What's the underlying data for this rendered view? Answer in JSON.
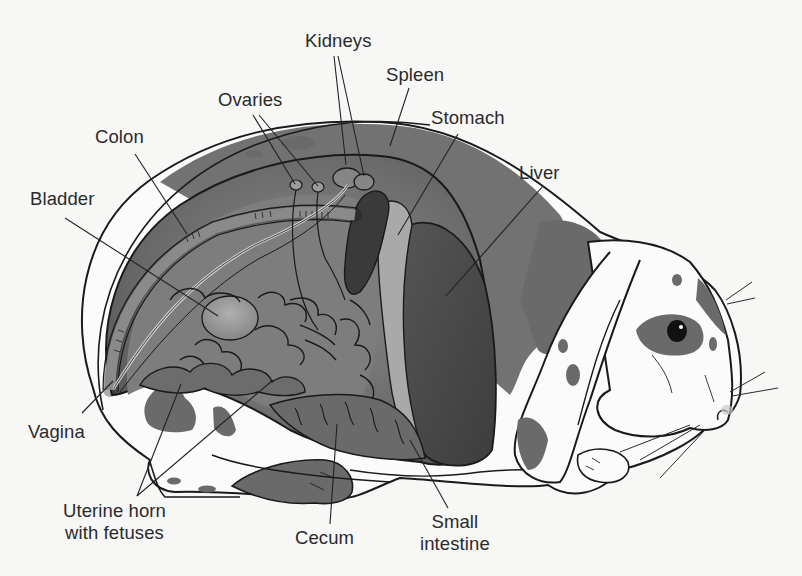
{
  "figure": {
    "colors": {
      "background": "#f7f7f6",
      "body_fur_white": "#fbfbfb",
      "body_spot": "#6a6a6a",
      "cavity_outer": "#5e5e5e",
      "cavity_inner": "#7a7a7a",
      "liver": "#4a4a4a",
      "stomach": "#a9a9a9",
      "spleen": "#3a3a3a",
      "intestine": "#6c6c6c",
      "bladder": "#8f8f8f",
      "outline": "#1a1a1a",
      "label_text": "#2a2a2a"
    }
  },
  "labels": [
    {
      "id": "kidneys",
      "lines": [
        "Kidneys"
      ],
      "x": 305,
      "y": 30,
      "align": "left",
      "leaders": [
        [
          334,
          56,
          346,
          165
        ],
        [
          338,
          56,
          364,
          176
        ]
      ]
    },
    {
      "id": "spleen",
      "lines": [
        "Spleen"
      ],
      "x": 386,
      "y": 64,
      "align": "left",
      "leaders": [
        [
          409,
          88,
          390,
          146
        ]
      ]
    },
    {
      "id": "ovaries",
      "lines": [
        "Ovaries"
      ],
      "x": 218,
      "y": 89,
      "align": "left",
      "leaders": [
        [
          253,
          115,
          295,
          184
        ],
        [
          259,
          115,
          318,
          186
        ]
      ]
    },
    {
      "id": "stomach",
      "lines": [
        "Stomach"
      ],
      "x": 431,
      "y": 107,
      "align": "left",
      "leaders": [
        [
          458,
          134,
          398,
          235
        ]
      ]
    },
    {
      "id": "colon",
      "lines": [
        "Colon"
      ],
      "x": 95,
      "y": 126,
      "align": "left",
      "leaders": [
        [
          135,
          154,
          187,
          234
        ]
      ]
    },
    {
      "id": "liver",
      "lines": [
        "Liver"
      ],
      "x": 519,
      "y": 162,
      "align": "left",
      "leaders": [
        [
          543,
          186,
          446,
          296
        ]
      ]
    },
    {
      "id": "bladder",
      "lines": [
        "Bladder"
      ],
      "x": 30,
      "y": 188,
      "align": "left",
      "leaders": [
        [
          65,
          218,
          218,
          316
        ]
      ]
    },
    {
      "id": "vagina",
      "lines": [
        "Vagina"
      ],
      "x": 28,
      "y": 421,
      "align": "left",
      "leaders": [
        [
          82,
          413,
          113,
          381
        ]
      ]
    },
    {
      "id": "uterine-horn",
      "lines": [
        "Uterine horn",
        "with fetuses"
      ],
      "x": 63,
      "y": 500,
      "align": "center",
      "leaders": [
        [
          137,
          496,
          181,
          384
        ],
        [
          137,
          496,
          273,
          380
        ]
      ]
    },
    {
      "id": "cecum",
      "lines": [
        "Cecum"
      ],
      "x": 295,
      "y": 527,
      "align": "left",
      "leaders": [
        [
          330,
          524,
          337,
          424
        ]
      ]
    },
    {
      "id": "small-intestine",
      "lines": [
        "Small",
        "intestine"
      ],
      "x": 420,
      "y": 511,
      "align": "center",
      "leaders": [
        [
          448,
          508,
          410,
          440
        ]
      ]
    }
  ]
}
